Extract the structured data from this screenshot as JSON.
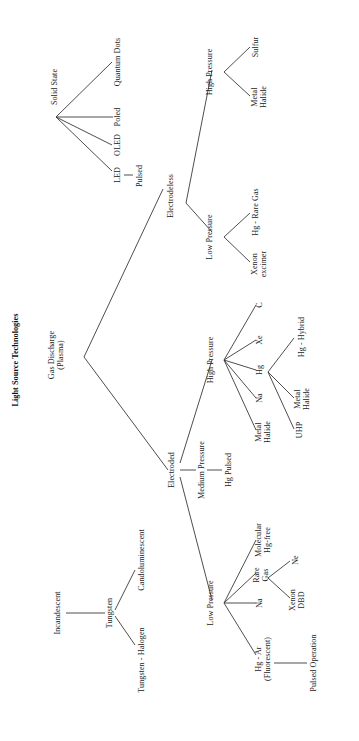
{
  "figure": {
    "title": "Light Source Technologies",
    "orientation": "rotated-90-ccw",
    "type": "tree-diagram"
  },
  "nodes": {
    "root": "Light Source Technologies",
    "incandescent": "Incandescent",
    "tungsten": "Tungsten",
    "tungsten_halogen": "Tungsten - Halogen",
    "candoluminescent": "Candoluminescent",
    "gas_discharge": "Gas Discharge\n(Plasma)",
    "solid_state": "Solid State",
    "led": "LED",
    "oled": "OLED",
    "poled": "Poled",
    "quantum_dots": "Quantum Dots",
    "pulsed": "Pulsed",
    "electrodeless": "Electrodeless",
    "electroded": "Electroded",
    "el_low_pressure": "Low Pressure",
    "el_high_pressure": "High Pressure",
    "xenon_excimer": "Xenon\nexcimer",
    "hg_rare_gas": "Hg - Rare Gas",
    "metal_halide_el": "Metal\nHalide",
    "sulfur": "Sulfur",
    "ed_medium_pressure": "Medium Pressure",
    "hg_pulsed": "Hg Pulsed",
    "ed_high_pressure": "High Pressure",
    "hp_metal_halide": "Metal\nHalide",
    "hp_na": "Na",
    "hp_hg": "Hg",
    "hp_xe": "Xe",
    "hp_c": "C",
    "uhp": "UHP",
    "hg_metal_halide": "Metal\nHalide",
    "hg_hybrid": "Hg - Hybrid",
    "ed_low_pressure": "Low Pressure",
    "hg_ar_fluorescent": "Hg - Ar\n(Fluorescent)",
    "pulsed_operation": "Pulsed Operation",
    "lp_na": "Na",
    "rare_gas": "Rare\nGas",
    "molecular_hg_free": "Molecular\nHg-free",
    "ne": "Ne",
    "xenon_dbd": "Xenon\nDBD"
  },
  "colors": {
    "background": "#ffffff",
    "text": "#1b1b1b",
    "edge": "#3a3a3a"
  }
}
